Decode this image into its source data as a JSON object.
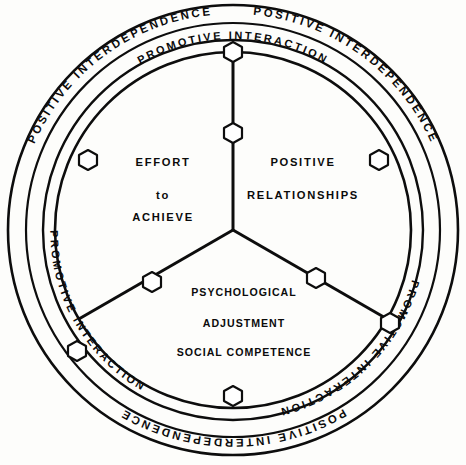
{
  "diagram": {
    "geometry": {
      "center_x": 233,
      "center_y": 230,
      "radius_outer": 225,
      "radius_outer_inner": 208,
      "radius_band_inner": 190,
      "radius_core": 178
    },
    "colors": {
      "stroke": "#0d0d0d",
      "background": "#fdfdfb",
      "node_fill": "#ffffff"
    },
    "outer_ring_labels": [
      {
        "text": "POSITIVE INTERDEPENDENCE",
        "position": "upper-left"
      },
      {
        "text": "POSITIVE INTERDEPENDENCE",
        "position": "upper-right"
      },
      {
        "text": "POSITIVE INTERDEPENDENCE",
        "position": "bottom"
      }
    ],
    "inner_ring_labels": [
      {
        "text": "PROMOTIVE INTERACTION",
        "position": "top"
      },
      {
        "text": "PROMOTIVE INTERACTION",
        "position": "right"
      },
      {
        "text": "PROMOTIVE INTERACTION",
        "position": "lower-left"
      }
    ],
    "sectors": [
      {
        "name": "effort-to-achieve",
        "position": "upper-left",
        "lines": [
          "EFFORT",
          "to",
          "ACHIEVE"
        ]
      },
      {
        "name": "positive-relationships",
        "position": "upper-right",
        "lines": [
          "POSITIVE",
          "RELATIONSHIPS"
        ]
      },
      {
        "name": "psychological-adjustment",
        "position": "bottom",
        "lines": [
          "PSYCHOLOGICAL",
          "ADJUSTMENT",
          "SOCIAL COMPETENCE"
        ]
      }
    ],
    "node_markers": {
      "shape": "hexagon",
      "count": 9,
      "description": "hexagonal connector markers on spokes and circle boundary"
    }
  }
}
